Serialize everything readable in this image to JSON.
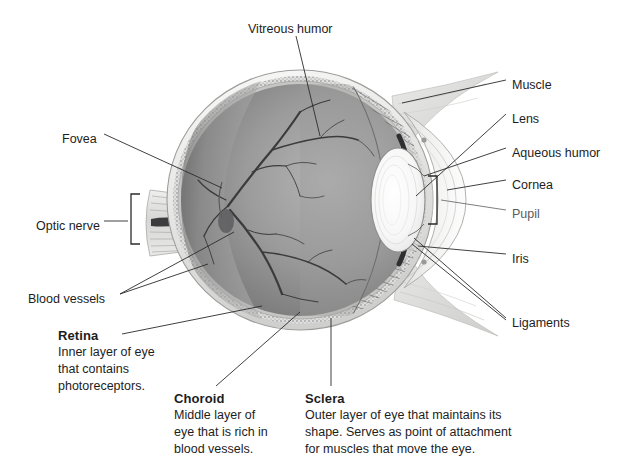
{
  "figure": {
    "background": "#ffffff"
  },
  "callout_labels": [
    {
      "id": "vitreous-humor",
      "text": "Vitreous humor",
      "x": 248,
      "y": 21
    },
    {
      "id": "muscle",
      "text": "Muscle",
      "x": 512,
      "y": 77
    },
    {
      "id": "lens",
      "text": "Lens",
      "x": 512,
      "y": 111
    },
    {
      "id": "aqueous-humor",
      "text": "Aqueous humor",
      "x": 512,
      "y": 145
    },
    {
      "id": "cornea",
      "text": "Cornea",
      "x": 512,
      "y": 177
    },
    {
      "id": "pupil",
      "text": "Pupil",
      "x": 512,
      "y": 206
    },
    {
      "id": "iris",
      "text": "Iris",
      "x": 512,
      "y": 251
    },
    {
      "id": "ligaments",
      "text": "Ligaments",
      "x": 512,
      "y": 315
    },
    {
      "id": "fovea",
      "text": "Fovea",
      "x": 62,
      "y": 131
    },
    {
      "id": "optic-nerve",
      "text": "Optic nerve",
      "x": 36,
      "y": 218
    },
    {
      "id": "blood-vessels",
      "text": "Blood vessels",
      "x": 28,
      "y": 291
    }
  ],
  "definition_blocks": [
    {
      "id": "retina",
      "heading": "Retina",
      "body": "Inner layer of eye\nthat contains\nphotoreceptors.",
      "x": 58,
      "y": 327
    },
    {
      "id": "choroid",
      "heading": "Choroid",
      "body": "Middle layer of\neye that is rich in\nblood vessels.",
      "x": 174,
      "y": 390
    },
    {
      "id": "sclera",
      "heading": "Sclera",
      "body": "Outer layer of eye that maintains its\nshape. Serves as point of attachment\nfor muscles that move the eye.",
      "x": 305,
      "y": 390
    }
  ],
  "palette": {
    "ink": "#1d1d1d",
    "leader": "#2b2b2b",
    "sclera_outer": "#f2f2f0",
    "sclera_shade": "#d8d8d6",
    "choroid_band": "#b9b9b7",
    "retina_band": "#cfcfcd",
    "vitreous_light": "#a9a9a9",
    "vitreous_dark": "#6e6e6e",
    "vessel": "#3a3a3c",
    "ciliary": "#8d8d8d",
    "lens_body": "#fbfbfb",
    "lens_ring": "#dedede",
    "iris_dark": "#2f2f31",
    "cornea": "#efefee",
    "muscle": "#dcdcda"
  }
}
